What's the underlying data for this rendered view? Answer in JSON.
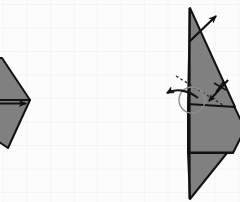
{
  "document": {
    "kind": "origami-fold-diagram",
    "title": "Origami folding step diagram",
    "background": {
      "name": "graph-paper",
      "paper_color": "#fcfcfc",
      "grid_color": "#e7e9ec",
      "grid_spacing_px": 23.5,
      "grid_origin_x": 3,
      "grid_origin_y": 4
    },
    "canvas": {
      "width": 240,
      "height": 202
    }
  },
  "style": {
    "fill_gray": "#808080",
    "fill_gray_dark": "#767676",
    "stroke_black": "#111111",
    "stroke_width": 2,
    "dashed_stroke": "#2b2b2b",
    "rotation_stroke": "#4a4a4a",
    "circle_stroke": "#8d8d8d"
  },
  "figures": [
    {
      "id": "left-model",
      "name": "left-folded-model",
      "label": "",
      "clipped_at_left_edge": true,
      "shapes": [
        {
          "name": "left-upper-flap",
          "points": "-18,58 2,58 30,100 -4,118 -20,96",
          "fill": "#808080"
        },
        {
          "name": "left-lower-flap",
          "points": "-20,100 30,100 8,148 -16,132",
          "fill": "#808080"
        }
      ],
      "arrows": [
        {
          "name": "left-push-arrow",
          "type": "straight",
          "from_x": -6,
          "from_y": 103,
          "to_x": 30,
          "to_y": 103,
          "head": "solid-triangle"
        }
      ]
    },
    {
      "id": "right-model",
      "name": "right-folded-model",
      "label": "",
      "clipped_at_right_edge": true,
      "shapes": [
        {
          "name": "right-main-triangle",
          "points": "190,8 234,106 188,104",
          "fill": "#808080"
        },
        {
          "name": "right-lower-body",
          "points": "188,104 234,106 244,128 232,152 188,152",
          "fill": "#808080"
        },
        {
          "name": "right-bottom-spike",
          "points": "188,152 226,152 190,198",
          "fill": "#808080"
        }
      ],
      "fold_lines": [
        {
          "name": "dashed-fold-line",
          "type": "dashed",
          "from_x": 176,
          "from_y": 76,
          "to_x": 222,
          "to_y": 104
        }
      ],
      "arrows": [
        {
          "name": "unfold-arrow-top-right",
          "type": "straight",
          "from_x": 190,
          "from_y": 40,
          "to_x": 220,
          "to_y": 14,
          "head": "solid-barbed"
        },
        {
          "name": "fold-arrow-small",
          "type": "straight",
          "from_x": 226,
          "from_y": 82,
          "to_x": 208,
          "to_y": 104,
          "head": "solid-barbed",
          "cross_mark": true
        },
        {
          "name": "rotation-arrow",
          "type": "curved",
          "from_x": 196,
          "from_y": 98,
          "to_x": 166,
          "to_y": 94,
          "head": "solid-barbed",
          "circle": {
            "cx": 192,
            "cy": 100,
            "r": 13
          }
        }
      ]
    }
  ]
}
